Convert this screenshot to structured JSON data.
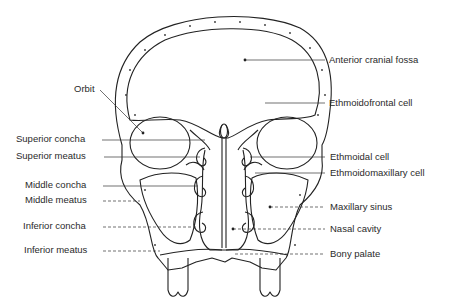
{
  "figure": {
    "type": "anatomical line drawing"
  },
  "labels_left": [
    {
      "text": "Orbit",
      "x": 74,
      "y": 83
    },
    {
      "text": "Superior concha",
      "x": 16,
      "y": 133
    },
    {
      "text": "Superior meatus",
      "x": 16,
      "y": 150
    },
    {
      "text": "Middle concha",
      "x": 25,
      "y": 179
    },
    {
      "text": "Middle meatus",
      "x": 25,
      "y": 194
    },
    {
      "text": "Inferior concha",
      "x": 23,
      "y": 220
    },
    {
      "text": "Inferior meatus",
      "x": 24,
      "y": 244
    }
  ],
  "labels_right": [
    {
      "text": "Anterior cranial fossa",
      "x": 329,
      "y": 54
    },
    {
      "text": "Ethmoidofrontal cell",
      "x": 329,
      "y": 95
    },
    {
      "text": "Ethmoidal cell",
      "x": 330,
      "y": 150
    },
    {
      "text": "Ethmoidomaxillary cell",
      "x": 330,
      "y": 166
    },
    {
      "text": "Maxillary sinus",
      "x": 330,
      "y": 200
    },
    {
      "text": "Nasal cavity",
      "x": 330,
      "y": 222
    },
    {
      "text": "Bony palate",
      "x": 330,
      "y": 248
    }
  ]
}
